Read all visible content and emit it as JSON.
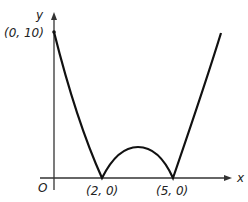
{
  "figure": {
    "type": "function-sketch",
    "axes": {
      "x_label": "x",
      "y_label": "y",
      "origin_label": "O"
    },
    "points": [
      {
        "label": "(0, 10)",
        "x": 0,
        "y": 10
      },
      {
        "label": "(2, 0)",
        "x": 2,
        "y": 0
      },
      {
        "label": "(5, 0)",
        "x": 5,
        "y": 0
      }
    ]
  },
  "colors": {
    "curve": "#111111",
    "axes": "#333333",
    "background": "#ffffff"
  }
}
